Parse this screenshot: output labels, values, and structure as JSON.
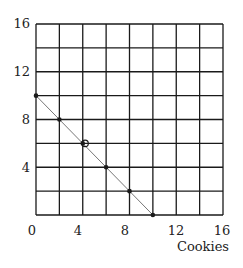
{
  "chart_data": {
    "type": "line",
    "title": "",
    "xlabel": "Cookies",
    "ylabel": "",
    "xlim": [
      0,
      16
    ],
    "ylim": [
      0,
      16
    ],
    "grid": true,
    "grid_step": 2,
    "x_ticks": [
      "0",
      "4",
      "8",
      "12",
      "16"
    ],
    "y_ticks": [
      "4",
      "8",
      "12",
      "16"
    ],
    "series": [
      {
        "name": "line",
        "x": [
          0,
          2,
          4,
          6,
          8,
          10
        ],
        "y": [
          10,
          8,
          6,
          4,
          2,
          0
        ]
      }
    ],
    "open_marker": {
      "x": 4.2,
      "y": 6
    }
  },
  "axis": {
    "x_label": "Cookies",
    "x_tick_labels": [
      "0",
      "4",
      "8",
      "12",
      "16"
    ],
    "y_tick_labels": [
      "4",
      "8",
      "12",
      "16"
    ]
  },
  "colors": {
    "grid": "#1a1a1a",
    "line": "#777777",
    "points": "#1a1a1a"
  }
}
